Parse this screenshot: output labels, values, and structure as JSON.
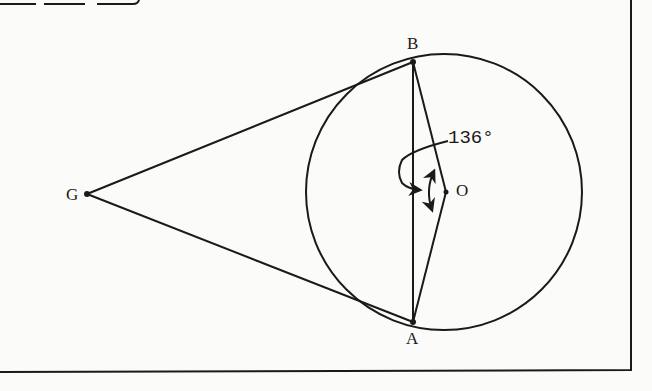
{
  "figure": {
    "type": "geometry-diagram",
    "colors": {
      "ink": "#1a1a1a",
      "paper": "#fbfbf9"
    }
  },
  "points": {
    "B": {
      "label": "B",
      "x": 413,
      "y": 62
    },
    "A": {
      "label": "A",
      "x": 413,
      "y": 322
    },
    "O": {
      "label": "O",
      "x": 446,
      "y": 192
    },
    "G": {
      "label": "G",
      "x": 87,
      "y": 194
    }
  },
  "circle": {
    "center_label": "O",
    "cx": 444,
    "cy": 192,
    "r": 138
  },
  "segments": [
    {
      "from": "G",
      "to": "B"
    },
    {
      "from": "G",
      "to": "A"
    },
    {
      "from": "B",
      "to": "A"
    },
    {
      "from": "O",
      "to": "B"
    },
    {
      "from": "O",
      "to": "A"
    }
  ],
  "annotations": {
    "angle_BOA": {
      "label": "136°",
      "vertex": "O"
    }
  }
}
